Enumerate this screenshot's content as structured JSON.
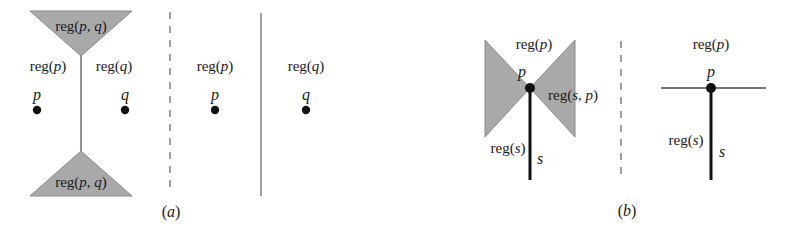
{
  "figure": {
    "width": 787,
    "height": 237,
    "background": "#ffffff",
    "shade_color": "#a9a9a9",
    "shade_stroke": "#8a8a8a",
    "line_color": "#4a4a4a",
    "thick_line_color": "#1a1a1a",
    "text_color": "#1a1a1a",
    "captions": [
      {
        "id": "caption-a",
        "label": "(a)",
        "x": 171,
        "y": 212
      },
      {
        "id": "caption-b",
        "label": "(b)",
        "x": 627,
        "y": 211
      }
    ]
  },
  "panel_a": {
    "name": "panel-a",
    "left_subfigure": {
      "name": "bisector-diagram",
      "top_triangle": {
        "name": "top-shaded-triangle",
        "points": "30,11 132,11 81,56",
        "label": "reg(p, q)",
        "label_x": 81,
        "label_y": 26
      },
      "bottom_triangle": {
        "name": "bottom-shaded-triangle",
        "points": "30,196 132,196 81,151",
        "label": "reg(p, q)",
        "label_x": 81,
        "label_y": 182
      },
      "bisector_line": {
        "name": "bisector-line",
        "x": 81,
        "y1": 56,
        "y2": 151
      },
      "region_labels": [
        {
          "name": "region-label-p",
          "text": "reg(p)",
          "x": 48,
          "y": 66
        },
        {
          "name": "region-label-q",
          "text": "reg(q)",
          "x": 114,
          "y": 66
        }
      ],
      "sites": [
        {
          "name": "site-p",
          "label": "p",
          "label_x": 37,
          "label_y": 95,
          "dot_x": 37,
          "dot_y": 110
        },
        {
          "name": "site-q",
          "label": "q",
          "label_x": 125,
          "label_y": 95,
          "dot_x": 125,
          "dot_y": 110
        }
      ]
    },
    "divider_dashed": {
      "name": "panel-a-dashed-divider",
      "x": 170,
      "y1": 12,
      "y2": 193
    },
    "divider_solid": {
      "name": "panel-a-solid-divider",
      "x": 261,
      "y1": 13,
      "y2": 196
    },
    "middle_subfigure": {
      "name": "reg-p-only-diagram",
      "region_label": {
        "name": "region-label-p",
        "text": "reg(p)",
        "x": 215,
        "y": 66
      },
      "site": {
        "name": "site-p",
        "label": "p",
        "label_x": 215,
        "label_y": 95,
        "dot_x": 215,
        "dot_y": 110
      }
    },
    "right_subfigure": {
      "name": "reg-q-only-diagram",
      "region_label": {
        "name": "region-label-q",
        "text": "reg(q)",
        "x": 306,
        "y": 66
      },
      "site": {
        "name": "site-q",
        "label": "q",
        "label_x": 306,
        "label_y": 95,
        "dot_x": 306,
        "dot_y": 110
      }
    }
  },
  "panel_b": {
    "name": "panel-b",
    "left_subfigure": {
      "name": "bowtie-diagram",
      "left_triangle": {
        "name": "left-shaded-triangle",
        "points": "485,40 530,88 485,137"
      },
      "right_triangle": {
        "name": "right-shaded-triangle",
        "points": "575,40 530,88 575,137"
      },
      "segment_s": {
        "name": "segment-s",
        "x": 530,
        "y1": 88,
        "y2": 180
      },
      "site": {
        "name": "site-p",
        "label": "p",
        "label_x": 522,
        "label_y": 72,
        "dot_x": 530,
        "dot_y": 88
      },
      "labels": [
        {
          "name": "region-label-p",
          "text": "reg(p)",
          "x": 534,
          "y": 44
        },
        {
          "name": "region-label-s-p",
          "text": "reg(s, p)",
          "x": 573,
          "y": 95
        },
        {
          "name": "region-label-s",
          "text": "reg(s)",
          "x": 508,
          "y": 148
        },
        {
          "name": "segment-label-s",
          "text": "s",
          "x": 540,
          "y": 159
        }
      ]
    },
    "divider_dashed": {
      "name": "panel-b-dashed-divider",
      "x": 621,
      "y1": 41,
      "y2": 181
    },
    "right_subfigure": {
      "name": "degenerate-diagram",
      "horizontal_line": {
        "name": "horizontal-line",
        "x1": 661,
        "x2": 766,
        "y": 88
      },
      "segment_s": {
        "name": "segment-s",
        "x": 711,
        "y1": 88,
        "y2": 180
      },
      "site": {
        "name": "site-p",
        "label": "p",
        "label_x": 711,
        "label_y": 72,
        "dot_x": 711,
        "dot_y": 88
      },
      "labels": [
        {
          "name": "region-label-p",
          "text": "reg(p)",
          "x": 711,
          "y": 44
        },
        {
          "name": "region-label-s",
          "text": "reg(s)",
          "x": 686,
          "y": 140
        },
        {
          "name": "segment-label-s",
          "text": "s",
          "x": 722,
          "y": 152
        }
      ]
    }
  }
}
